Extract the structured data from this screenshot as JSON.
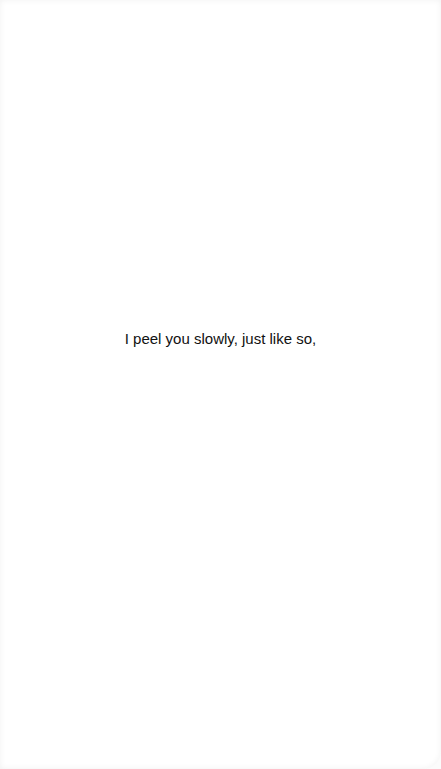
{
  "content": {
    "line": "I peel you slowly, just like so,"
  }
}
